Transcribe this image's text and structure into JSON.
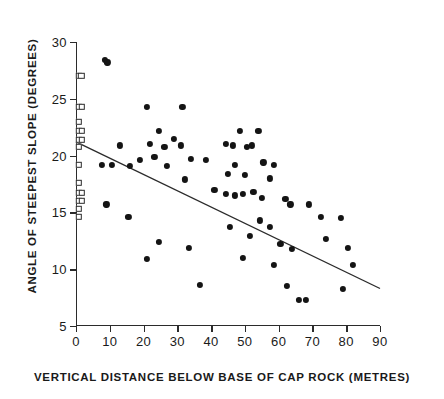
{
  "chart_data": {
    "type": "scatter",
    "title": "",
    "xlabel": "VERTICAL  DISTANCE  BELOW  BASE  OF  CAP  ROCK  (METRES)",
    "ylabel": "ANGLE  OF  STEEPEST  SLOPE  (DEGREES)",
    "xlim": [
      0,
      90
    ],
    "ylim": [
      5,
      30
    ],
    "xticks": [
      0,
      10,
      20,
      30,
      40,
      50,
      60,
      70,
      80,
      90
    ],
    "yticks": [
      5,
      10,
      15,
      20,
      25,
      30
    ],
    "grid": false,
    "legend": "none",
    "marker_color": "#141414",
    "line_color": "#2b2b2b",
    "series": [
      {
        "name": "slope measurements",
        "marker": "filled-circle",
        "points": [
          [
            8.6,
            28.4
          ],
          [
            9.3,
            28.2
          ],
          [
            21.0,
            24.3
          ],
          [
            31.5,
            24.3
          ],
          [
            13.0,
            20.9
          ],
          [
            24.5,
            22.2
          ],
          [
            29.0,
            21.5
          ],
          [
            21.8,
            21.0
          ],
          [
            26.2,
            20.8
          ],
          [
            31.0,
            20.9
          ],
          [
            7.6,
            19.2
          ],
          [
            10.6,
            19.2
          ],
          [
            16.0,
            19.1
          ],
          [
            18.8,
            19.6
          ],
          [
            27.0,
            19.1
          ],
          [
            34.0,
            19.7
          ],
          [
            38.5,
            19.6
          ],
          [
            23.2,
            19.9
          ],
          [
            32.2,
            17.9
          ],
          [
            44.5,
            21.0
          ],
          [
            50.5,
            20.8
          ],
          [
            48.5,
            22.2
          ],
          [
            54.0,
            22.2
          ],
          [
            46.5,
            20.9
          ],
          [
            52.0,
            20.9
          ],
          [
            47.0,
            19.2
          ],
          [
            55.5,
            19.4
          ],
          [
            58.5,
            19.2
          ],
          [
            45.0,
            18.4
          ],
          [
            50.0,
            18.3
          ],
          [
            57.5,
            18.0
          ],
          [
            44.5,
            16.6
          ],
          [
            49.5,
            16.6
          ],
          [
            52.5,
            16.8
          ],
          [
            47.0,
            16.5
          ],
          [
            41.0,
            17.0
          ],
          [
            55.0,
            16.3
          ],
          [
            62.0,
            16.2
          ],
          [
            63.5,
            15.7
          ],
          [
            69.0,
            15.7
          ],
          [
            72.5,
            14.6
          ],
          [
            9.0,
            15.7
          ],
          [
            15.5,
            14.6
          ],
          [
            24.5,
            12.4
          ],
          [
            21.0,
            10.9
          ],
          [
            33.5,
            11.9
          ],
          [
            36.8,
            8.6
          ],
          [
            45.5,
            13.7
          ],
          [
            51.5,
            12.9
          ],
          [
            57.5,
            13.7
          ],
          [
            54.5,
            14.3
          ],
          [
            60.5,
            12.2
          ],
          [
            64.0,
            11.8
          ],
          [
            49.5,
            11.0
          ],
          [
            58.5,
            10.4
          ],
          [
            62.5,
            8.5
          ],
          [
            66.0,
            7.3
          ],
          [
            68.0,
            7.3
          ],
          [
            74.0,
            12.7
          ],
          [
            78.5,
            14.5
          ],
          [
            80.5,
            11.9
          ],
          [
            82.0,
            10.4
          ],
          [
            79.0,
            8.3
          ]
        ]
      },
      {
        "name": "cap rock base measurements",
        "marker": "open-square",
        "points": [
          [
            0.8,
            27.0
          ],
          [
            1.6,
            27.0
          ],
          [
            0.8,
            24.3
          ],
          [
            1.7,
            24.3
          ],
          [
            0.8,
            23.0
          ],
          [
            0.8,
            22.2
          ],
          [
            1.7,
            22.2
          ],
          [
            0.8,
            21.4
          ],
          [
            1.7,
            21.4
          ],
          [
            0.8,
            20.8
          ],
          [
            0.8,
            19.2
          ],
          [
            0.8,
            17.6
          ],
          [
            0.8,
            16.7
          ],
          [
            1.7,
            16.7
          ],
          [
            0.8,
            16.0
          ],
          [
            1.7,
            16.0
          ],
          [
            0.8,
            15.3
          ],
          [
            0.8,
            14.6
          ]
        ]
      }
    ],
    "trendline": {
      "name": "least-squares regression line",
      "x_start": 0,
      "y_start": 21.2,
      "x_end": 90,
      "y_end": 8.3
    }
  }
}
